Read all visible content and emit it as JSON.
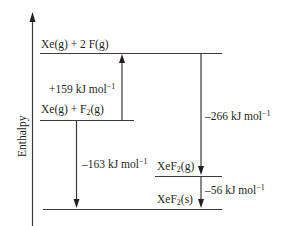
{
  "diagram": {
    "type": "enthalpy-level-diagram",
    "y_axis_label": "Enthalpy",
    "levels": [
      {
        "id": "xe_2f",
        "species": "Xe(g) + 2 F(g)",
        "parts": [
          "Xe(g) + 2 F(g)",
          "",
          ""
        ]
      },
      {
        "id": "xe_f2",
        "species": "Xe(g) + F2(g)",
        "parts": [
          "Xe(g) + F",
          "2",
          "(g)"
        ]
      },
      {
        "id": "xef2_g",
        "species": "XeF2(g)",
        "parts": [
          "XeF",
          "2",
          "(g)"
        ]
      },
      {
        "id": "xef2_s",
        "species": "XeF2(s)",
        "parts": [
          "XeF",
          "2",
          "(s)"
        ]
      }
    ],
    "transitions": [
      {
        "from": "xe_f2",
        "to": "xe_2f",
        "value": "+159",
        "unit": "kJ mol",
        "exp": "−1",
        "direction": "up"
      },
      {
        "from": "xe_2f",
        "to": "xef2_g",
        "value": "–266",
        "unit": "kJ mol",
        "exp": "−1",
        "direction": "down"
      },
      {
        "from": "xe_f2",
        "to": "xef2_s",
        "value": "–163",
        "unit": "kJ mol",
        "exp": "−1",
        "direction": "down"
      },
      {
        "from": "xef2_g",
        "to": "xef2_s",
        "value": "–56",
        "unit": "kJ mol",
        "exp": "−1",
        "direction": "down"
      }
    ]
  }
}
